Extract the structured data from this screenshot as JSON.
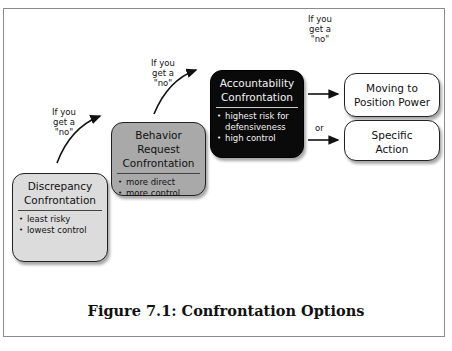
{
  "figure": {
    "caption": "Figure 7.1: Confrontation Options"
  },
  "transition_label": [
    "If you",
    "get a",
    "\"no\""
  ],
  "or_label": "or",
  "boxes": {
    "discrepancy": {
      "title_lines": [
        "Discrepancy",
        "Confrontation"
      ],
      "bullets": [
        "least risky",
        "lowest control"
      ],
      "fill": "#dcdcdc"
    },
    "behavior_request": {
      "title_lines": [
        "Behavior",
        "Request",
        "Confrontation"
      ],
      "bullets": [
        "more direct",
        "more control"
      ],
      "fill": "#a9a9a9"
    },
    "accountability": {
      "title_lines": [
        "Accountability",
        "Confrontation"
      ],
      "bullets": [
        "highest risk for defensiveness",
        "high control"
      ],
      "fill": "#0a0a0a"
    },
    "moving_to_position_power": {
      "title_lines": [
        "Moving to",
        "Position Power"
      ],
      "fill": "#ffffff"
    },
    "specific_action": {
      "title_lines": [
        "Specific",
        "Action"
      ],
      "fill": "#ffffff"
    }
  }
}
